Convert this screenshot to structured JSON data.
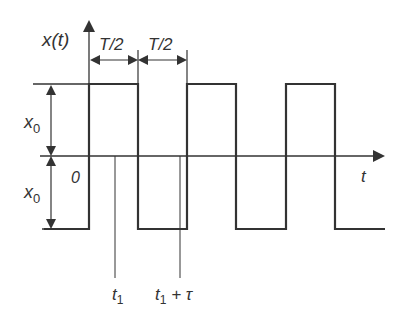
{
  "diagram": {
    "type": "square-wave-timing",
    "labels": {
      "y_axis": "x(t)",
      "x_axis": "t",
      "origin": "0",
      "half_period_1": "T/2",
      "half_period_2": "T/2",
      "amplitude_top": "x",
      "amplitude_top_sub": "0",
      "amplitude_bottom": "x",
      "amplitude_bottom_sub": "0",
      "t1": "t",
      "t1_sub": "1",
      "t1_tau": "t",
      "t1_tau_sub": "1",
      "t1_tau_rest": " + τ"
    },
    "colors": {
      "line": "#333333",
      "background": "#ffffff"
    }
  }
}
